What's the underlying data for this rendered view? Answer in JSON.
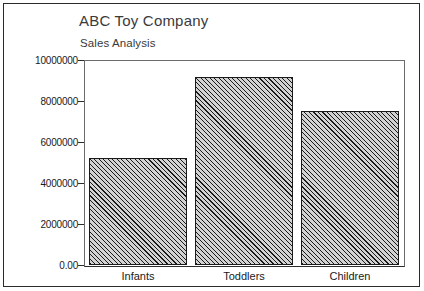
{
  "chart_data": {
    "type": "bar",
    "title": "ABC Toy Company",
    "subtitle": "Sales Analysis",
    "categories": [
      "Infants",
      "Toddlers",
      "Children"
    ],
    "values": [
      5200000,
      9170000,
      7510000
    ],
    "series": [
      {
        "name": "Sales",
        "values": [
          5200000,
          9170000,
          7510000
        ]
      }
    ],
    "xlabel": "",
    "ylabel": "",
    "ylim": [
      0,
      10000000
    ],
    "ytick_values": [
      10000000,
      8000000,
      6000000,
      4000000,
      2000000,
      0
    ],
    "ytick_labels": [
      "10000000",
      "8000000",
      "6000000",
      "4000000",
      "2000000",
      "0.00"
    ],
    "grid": false,
    "legend": null,
    "bar_fill": "diagonal-hatch",
    "bar_fill_color": "#d2d2d2",
    "bar_line_color": "#1a1a1a",
    "frame_color": "#6b6b6b",
    "border_color": "#2b2b2b"
  }
}
